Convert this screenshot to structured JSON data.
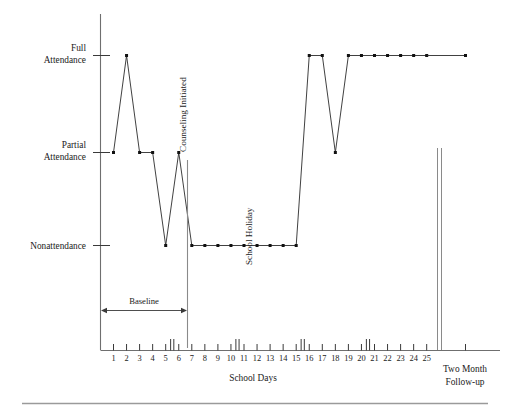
{
  "figure": {
    "axis_title_x": "School Days",
    "followup_label_line1": "Two Month",
    "followup_label_line2": "Follow-up",
    "annotations": {
      "counseling": "Counseling Initiated",
      "holiday": "School Holiday",
      "baseline": "Baseline"
    },
    "y_labels": [
      {
        "line1": "Full",
        "line2": "Attendance"
      },
      {
        "line1": "Partial",
        "line2": "Attendance"
      },
      {
        "line1": "Nonattendance",
        "line2": ""
      }
    ]
  },
  "chart_data": {
    "type": "line",
    "title": "",
    "subtitle": "",
    "xlabel": "School Days",
    "ylabel": "",
    "grid": false,
    "legend": "none",
    "y_categories": [
      "Nonattendance",
      "Partial Attendance",
      "Full Attendance"
    ],
    "y_tick_labels": [
      "Full Attendance",
      "Partial Attendance",
      "Nonattendance"
    ],
    "ylim": [
      0,
      2
    ],
    "xlim": [
      1,
      25
    ],
    "x_tick_labels": [
      "1",
      "2",
      "3",
      "4",
      "5",
      "6",
      "7",
      "8",
      "9",
      "10",
      "11",
      "12",
      "13",
      "14",
      "15",
      "16",
      "17",
      "18",
      "19",
      "20",
      "21",
      "22",
      "23",
      "24",
      "25"
    ],
    "extra_x_category": "Two Month Follow-up",
    "series": [
      {
        "name": "Attendance",
        "x": [
          1,
          2,
          3,
          4,
          5,
          6,
          7,
          8,
          9,
          10,
          11,
          12,
          13,
          14,
          15,
          16,
          17,
          18,
          19,
          20,
          21,
          22,
          23,
          24,
          25
        ],
        "values": [
          1,
          2,
          1,
          1,
          0,
          1,
          0,
          0,
          0,
          0,
          0,
          0,
          0,
          0,
          0,
          2,
          2,
          1,
          2,
          2,
          2,
          2,
          2,
          2,
          2
        ],
        "value_labels": [
          "Partial Attendance",
          "Full Attendance",
          "Partial Attendance",
          "Partial Attendance",
          "Nonattendance",
          "Partial Attendance",
          "Nonattendance",
          "Nonattendance",
          "Nonattendance",
          "Nonattendance",
          "Nonattendance",
          "Nonattendance",
          "Nonattendance",
          "Nonattendance",
          "Nonattendance",
          "Full Attendance",
          "Full Attendance",
          "Partial Attendance",
          "Full Attendance",
          "Full Attendance",
          "Full Attendance",
          "Full Attendance",
          "Full Attendance",
          "Full Attendance",
          "Full Attendance"
        ]
      },
      {
        "name": "Two Month Follow-up",
        "x": [
          "Two Month Follow-up"
        ],
        "values": [
          2
        ],
        "value_labels": [
          "Full Attendance"
        ]
      }
    ],
    "annotations": [
      {
        "text": "Counseling Initiated",
        "type": "phase-change-line",
        "x_between": [
          6,
          7
        ],
        "orientation": "vertical"
      },
      {
        "text": "School Holiday",
        "type": "vertical-text",
        "x_at": 12,
        "orientation": "vertical"
      },
      {
        "text": "Baseline",
        "type": "span-arrow",
        "x_from": 1,
        "x_to": 6.5
      }
    ],
    "weekend_breaks": [
      [
        5,
        6
      ],
      [
        10,
        11
      ],
      [
        15,
        16
      ],
      [
        20,
        21
      ]
    ],
    "axis_break": {
      "type": "double-vertical-line",
      "after_x": 25,
      "label": "Two Month Follow-up"
    }
  }
}
